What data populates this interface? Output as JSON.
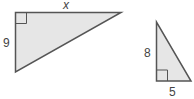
{
  "diagram": {
    "type": "similar-right-triangles",
    "colors": {
      "fill": "#e6e6e6",
      "stroke": "#555555",
      "label": "#444444"
    },
    "triangles": [
      {
        "id": "large",
        "labels": {
          "top_leg": "x",
          "left_leg": "9"
        },
        "right_angle_at": "top-left"
      },
      {
        "id": "small",
        "labels": {
          "left_leg": "8",
          "bottom_leg": "5"
        },
        "right_angle_at": "bottom-left"
      }
    ]
  }
}
